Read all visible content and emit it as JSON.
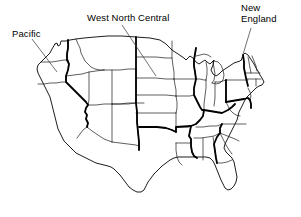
{
  "figure": {
    "kind": "map",
    "width": 301,
    "height": 217,
    "background_color": "#ffffff",
    "line_color": "#000000",
    "text_color": "#000000"
  },
  "annotations": [
    {
      "id": "pacific",
      "label": "Pacific",
      "lines": [
        "Pacific"
      ],
      "label_x": 12,
      "label_y": 29,
      "leader": {
        "x1": 32,
        "y1": 39,
        "x2": 57,
        "y2": 72
      }
    },
    {
      "id": "west-north-central",
      "label": "West North Central",
      "lines": [
        "West North Central"
      ],
      "label_x": 87,
      "label_y": 13,
      "leader": {
        "x1": 122,
        "y1": 25,
        "x2": 156,
        "y2": 76
      }
    },
    {
      "id": "new-england",
      "label": "New England",
      "lines": [
        "New",
        "England"
      ],
      "label_x": 241,
      "label_y": 3,
      "leader": {
        "x1": 251,
        "y1": 28,
        "x2": 241,
        "y2": 61
      }
    }
  ],
  "legend": {
    "state_border_label": "state boundary",
    "division_border_label": "census division boundary"
  }
}
